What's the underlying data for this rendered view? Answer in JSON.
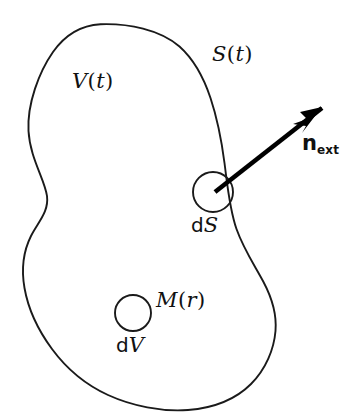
{
  "figure": {
    "name": "control-volume-diagram",
    "width": 353,
    "height": 420,
    "background_color": "#ffffff",
    "stroke_color": "#1a1a1a",
    "arrow_color": "#000000"
  },
  "labels": {
    "volume": {
      "text": "V(t)",
      "symbol": "V",
      "open_paren": "(",
      "arg": "t",
      "close_paren": ")"
    },
    "surface": {
      "text": "S(t)",
      "symbol": "S",
      "open_paren": "(",
      "arg": "t",
      "close_paren": ")"
    },
    "normal": {
      "text": "next",
      "symbol": "n",
      "subscript": "ext"
    },
    "surface_element": {
      "text": "dS",
      "d": "d",
      "symbol": "S"
    },
    "mass": {
      "text": "M(r)",
      "symbol": "M",
      "open_paren": "(",
      "arg": "r",
      "close_paren": ")"
    },
    "volume_element": {
      "text": "dV",
      "d": "d",
      "symbol": "V"
    }
  },
  "shapes": {
    "boundary": {
      "name": "surface-boundary-blob",
      "path": "M 100.5 24.2 C 128 23.2 160 29.5 179.5 46.5 C 194 59.5 203.5 77 210.5 98 C 217 117.5 221.5 140 224.5 163 C 227.5 186 229.5 209 236.5 229 C 243.5 249 255 266 263.5 282 C 272 298 277 313 275.5 331 C 274 349 266 369 251 384 C 236 399 214 408 188 410 C 162 412 132 406 108 395 C 84 384 66 368 52 349 C 38 330 28 308 24.5 288 C 21 268 24 250 31 236 C 38 222 49 212 47 196 C 45 180 30 158 28.5 131 C 27 104 39 72 53 52 C 67 32 83 25.2 100.5 24.2 Z"
    },
    "surface_element_circle": {
      "name": "ds-circle",
      "cx": 213,
      "cy": 192,
      "r": 20
    },
    "volume_element_circle": {
      "name": "dv-circle",
      "cx": 133,
      "cy": 313,
      "r": 18
    },
    "normal_arrow": {
      "name": "outward-normal-arrow",
      "x1": 215,
      "y1": 192,
      "x2": 322,
      "y2": 108,
      "head_points": "322,107 300,112 307,119 293,124 306,126 302,133"
    }
  }
}
